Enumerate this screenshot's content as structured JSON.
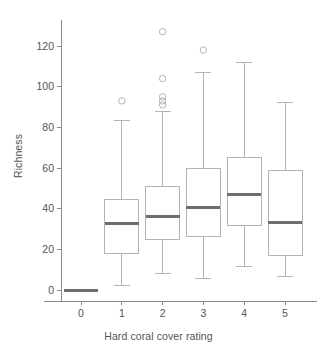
{
  "chart_data": {
    "type": "box",
    "title": "",
    "xlabel": "Hard coral cover rating",
    "ylabel": "Richness",
    "categories": [
      "0",
      "1",
      "2",
      "3",
      "4",
      "5"
    ],
    "xlim": [
      -0.55,
      5.55
    ],
    "ylim": [
      -6,
      133
    ],
    "yticks": [
      0,
      20,
      40,
      60,
      80,
      100,
      120
    ],
    "ytick_labels": [
      "0",
      "20",
      "40",
      "60",
      "80",
      "100",
      "120"
    ],
    "xtick_labels": [
      "0",
      "1",
      "2",
      "3",
      "4",
      "5"
    ],
    "grid": false,
    "legend": null,
    "boxes": [
      {
        "category": "0",
        "whisker_low": 0,
        "q1": 0,
        "median": 0,
        "q3": 0,
        "whisker_high": 0,
        "outliers": [],
        "degenerate": true
      },
      {
        "category": "1",
        "whisker_low": 2,
        "q1": 18,
        "median": 32.5,
        "q3": 44.5,
        "whisker_high": 83.5,
        "outliers": [
          93
        ],
        "degenerate": false
      },
      {
        "category": "2",
        "whisker_low": 8,
        "q1": 25,
        "median": 36,
        "q3": 51,
        "whisker_high": 88,
        "outliers": [
          91,
          93,
          95,
          104,
          127
        ],
        "degenerate": false
      },
      {
        "category": "3",
        "whisker_low": 5.5,
        "q1": 26.5,
        "median": 40.5,
        "q3": 60,
        "whisker_high": 107,
        "outliers": [
          118
        ],
        "degenerate": false
      },
      {
        "category": "4",
        "whisker_low": 11.5,
        "q1": 31.5,
        "median": 47,
        "q3": 65,
        "whisker_high": 112,
        "outliers": [],
        "degenerate": false
      },
      {
        "category": "5",
        "whisker_low": 6.5,
        "q1": 17,
        "median": 33,
        "q3": 59,
        "whisker_high": 92,
        "outliers": [],
        "degenerate": false
      }
    ],
    "colors": {
      "box_stroke": "#b4b4b4",
      "box_fill": "#ffffff",
      "median": "#6e6e6e",
      "whisker": "#b4b4b4",
      "outlier": "#b4b4b4",
      "axis": "#8a8a8a",
      "text": "#545454",
      "background": "#ffffff"
    }
  }
}
